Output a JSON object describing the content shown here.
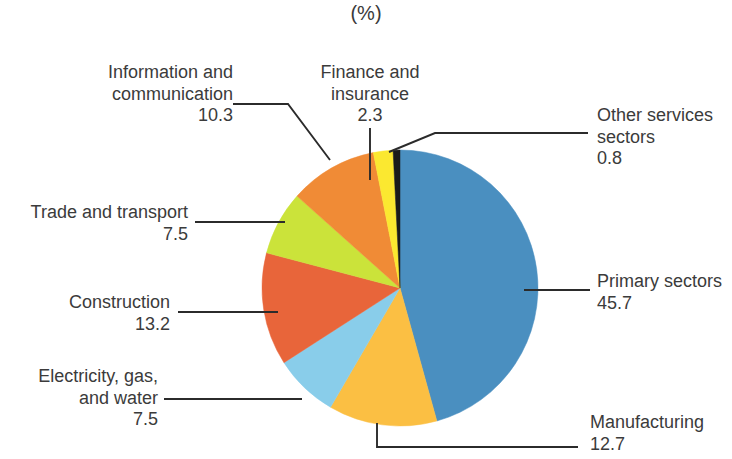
{
  "title": {
    "main": "Figure 1. Sector Composition of Employment, Timor-Leste, 2013",
    "unit": "(%)"
  },
  "chart_data": {
    "type": "pie",
    "title": "Figure 1. Sector Composition of Employment, Timor-Leste, 2013",
    "unit": "(%)",
    "value_suffix": "",
    "start_angle_deg": 0,
    "direction": "clockwise",
    "legend": "none",
    "labels": [
      "Primary sectors",
      "Manufacturing",
      "Electricity, gas, and water",
      "Construction",
      "Trade and transport",
      "Information and communication",
      "Finance and insurance",
      "Other services sectors"
    ],
    "values": [
      45.7,
      12.7,
      7.5,
      13.2,
      7.5,
      10.3,
      2.3,
      0.8
    ],
    "colors": [
      "#4a8fc0",
      "#fbbf43",
      "#89cdea",
      "#e8653a",
      "#cbe33a",
      "#f08b36",
      "#fbe830",
      "#1a1a1a"
    ],
    "slices": [
      {
        "label": "Primary sectors",
        "value": 45.7,
        "color": "#4a8fc0"
      },
      {
        "label": "Manufacturing",
        "value": 12.7,
        "color": "#fbbf43"
      },
      {
        "label": "Electricity, gas, and water",
        "value": 7.5,
        "color": "#89cdea"
      },
      {
        "label": "Construction",
        "value": 13.2,
        "color": "#e8653a"
      },
      {
        "label": "Trade and transport",
        "value": 7.5,
        "color": "#cbe33a"
      },
      {
        "label": "Information and communication",
        "value": 10.3,
        "color": "#f08b36"
      },
      {
        "label": "Finance and insurance",
        "value": 2.3,
        "color": "#fbe830"
      },
      {
        "label": "Other services sectors",
        "value": 0.8,
        "color": "#1a1a1a"
      }
    ]
  },
  "callouts": {
    "information": {
      "line1": "Information and",
      "line2": "communication",
      "value": "10.3"
    },
    "finance": {
      "line1": "Finance and",
      "line2": "insurance",
      "value": "2.3"
    },
    "other": {
      "line1": "Other services",
      "line2": "sectors",
      "value": "0.8"
    },
    "primary": {
      "line1": "Primary sectors",
      "value": "45.7"
    },
    "manufacturing": {
      "line1": "Manufacturing",
      "value": "12.7"
    },
    "trade": {
      "line1": "Trade and transport",
      "value": "7.5"
    },
    "construction": {
      "line1": "Construction",
      "value": "13.2"
    },
    "electricity": {
      "line1": "Electricity, gas,",
      "line2": "and water",
      "value": "7.5"
    }
  }
}
